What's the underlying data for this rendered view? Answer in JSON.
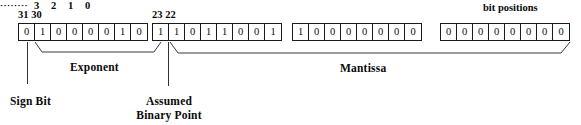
{
  "diagram": {
    "headers": {
      "high_bits": "31 30",
      "mid_bits": "23 22",
      "bit_positions_title": "bit positions",
      "low_bits_ellipsis": "········",
      "low_bits": [
        "3",
        "2",
        "1",
        "0"
      ]
    },
    "bytes": [
      {
        "name": "byte-0",
        "bits": [
          "0",
          "1",
          "0",
          "0",
          "0",
          "0",
          "1",
          "0"
        ]
      },
      {
        "name": "byte-1",
        "bits": [
          "1",
          "1",
          "0",
          "1",
          "1",
          "0",
          "0",
          "1"
        ]
      },
      {
        "name": "byte-2",
        "bits": [
          "1",
          "0",
          "0",
          "0",
          "0",
          "0",
          "0",
          "0"
        ]
      },
      {
        "name": "byte-3",
        "bits": [
          "0",
          "0",
          "0",
          "0",
          "0",
          "0",
          "0",
          "0"
        ]
      }
    ],
    "labels": {
      "exponent": "Exponent",
      "mantissa": "Mantissa",
      "sign_bit": "Sign Bit",
      "binary_point_line1": "Assumed",
      "binary_point_line2": "Binary Point"
    },
    "colors": {
      "background": "#ffffff",
      "ink": "#0a0a0a",
      "rule": "#333333"
    }
  }
}
